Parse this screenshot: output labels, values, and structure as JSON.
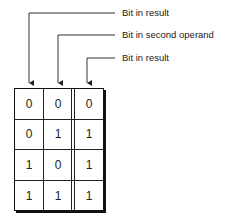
{
  "diagram": {
    "type": "bitwise truth table with callout labels",
    "callouts": [
      {
        "label": "Bit in result",
        "column": 0
      },
      {
        "label": "Bit in second operand",
        "column": 1
      },
      {
        "label": "Bit in result",
        "column": 2
      }
    ],
    "table": {
      "rows": [
        [
          "0",
          "0",
          "0"
        ],
        [
          "0",
          "1",
          "1"
        ],
        [
          "1",
          "0",
          "1"
        ],
        [
          "1",
          "1",
          "1"
        ]
      ]
    },
    "colors": {
      "line": "#222222",
      "background": "#ffffff"
    }
  }
}
